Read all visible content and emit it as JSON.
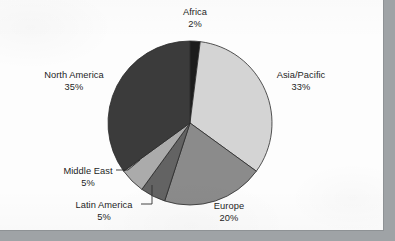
{
  "figure": {
    "background_color": "#fdfdfd",
    "page_margin_color": "#9fa3a6",
    "border_color": "#8e9295"
  },
  "chart_data": {
    "type": "pie",
    "title": "",
    "subtitle": "",
    "xlabel": "",
    "ylabel": "",
    "legend_position": "none",
    "grid": false,
    "value_unit": "%",
    "start_angle_deg": 0,
    "direction": "clockwise",
    "center": {
      "x": 190,
      "y": 123
    },
    "radius": 82,
    "categories": [
      "Africa",
      "Asia/Pacific",
      "Europe",
      "Latin America",
      "Middle East",
      "North America"
    ],
    "values": [
      2,
      33,
      20,
      5,
      5,
      35
    ],
    "slices": [
      {
        "label": "Africa",
        "value": 2,
        "value_text": "2%",
        "color": "#1c1c1c",
        "start_deg": 0,
        "end_deg": 7.2,
        "label_x": 195,
        "label_y": 7,
        "leader": false
      },
      {
        "label": "Asia/Pacific",
        "value": 33,
        "value_text": "33%",
        "color": "#d4d4d4",
        "start_deg": 7.2,
        "end_deg": 126,
        "label_x": 301,
        "label_y": 70,
        "leader": false
      },
      {
        "label": "Europe",
        "value": 20,
        "value_text": "20%",
        "color": "#8b8b8b",
        "start_deg": 126,
        "end_deg": 198,
        "label_x": 229,
        "label_y": 201,
        "leader": false
      },
      {
        "label": "Latin America",
        "value": 5,
        "value_text": "5%",
        "color": "#636363",
        "start_deg": 198,
        "end_deg": 216,
        "label_x": 104,
        "label_y": 200,
        "leader": true
      },
      {
        "label": "Middle East",
        "value": 5,
        "value_text": "5%",
        "color": "#ababab",
        "start_deg": 216,
        "end_deg": 234,
        "label_x": 88,
        "label_y": 166,
        "leader": true
      },
      {
        "label": "North America",
        "value": 35,
        "value_text": "35%",
        "color": "#3b3b3b",
        "start_deg": 234,
        "end_deg": 360,
        "label_x": 74,
        "label_y": 70,
        "leader": false
      }
    ]
  }
}
